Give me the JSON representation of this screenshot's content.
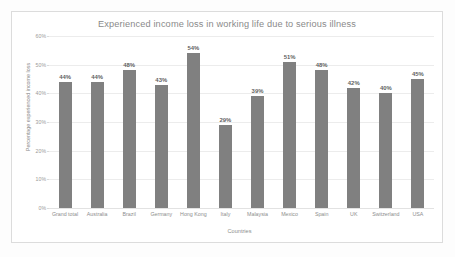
{
  "chart_data": {
    "type": "bar",
    "title": "Experienced income loss in working life due to serious illness",
    "xlabel": "Countries",
    "ylabel": "Percentage experienced income loss",
    "categories": [
      "Grand total",
      "Australia",
      "Brazil",
      "Germany",
      "Hong Kong",
      "Italy",
      "Malaysia",
      "Mexico",
      "Spain",
      "UK",
      "Switzerland",
      "USA"
    ],
    "values": [
      44,
      44,
      48,
      43,
      54,
      29,
      39,
      51,
      48,
      42,
      40,
      45
    ],
    "data_labels": [
      "44%",
      "44%",
      "48%",
      "43%",
      "54%",
      "29%",
      "39%",
      "51%",
      "48%",
      "42%",
      "40%",
      "45%"
    ],
    "ylim": [
      0,
      60
    ],
    "ytick_values": [
      0,
      10,
      20,
      30,
      40,
      50,
      60
    ],
    "ytick_labels": [
      "0%",
      "10%",
      "20%",
      "30%",
      "40%",
      "50%",
      "60%"
    ],
    "grid": true,
    "legend": false,
    "legend_position": "none",
    "bar_color": "#808080",
    "series": [
      {
        "name": "Percentage experienced income loss",
        "values": [
          44,
          44,
          48,
          43,
          54,
          29,
          39,
          51,
          48,
          42,
          40,
          45
        ]
      }
    ]
  }
}
